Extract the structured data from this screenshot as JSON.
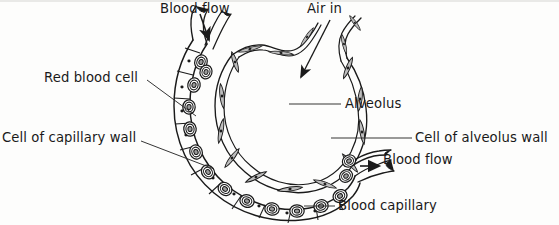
{
  "figure": {
    "kind": "biology-diagram",
    "ink_color": "#1a1a1a",
    "cell_fill": "#b9b9b9",
    "background": "#fdfdfc"
  },
  "labels": {
    "blood_flow_in": "Blood flow",
    "air_in": "Air in",
    "red_blood_cell": "Red blood cell",
    "alveolus": "Alveolus",
    "cell_of_capillary_wall": "Cell of capillary wall",
    "cell_of_alveolus_wall": "Cell of alveolus wall",
    "blood_flow_out": "Blood flow",
    "blood_capillary": "Blood capillary"
  },
  "icons": {
    "arrow_blood_in": "arrow-down-icon",
    "arrow_air_in": "arrow-diagonal-down-left-icon",
    "arrow_blood_out": "arrow-right-icon"
  },
  "structures": {
    "alveolus_wall": "inner wavy chain of flat spindle-shaped cells with nuclei",
    "capillary": "outer C-shaped tube wrapping the alveolus",
    "red_blood_cells": "concentric ring ovals inside the capillary lumen",
    "openings": [
      "capillary inlet at top-left",
      "capillary outlet at right"
    ]
  }
}
